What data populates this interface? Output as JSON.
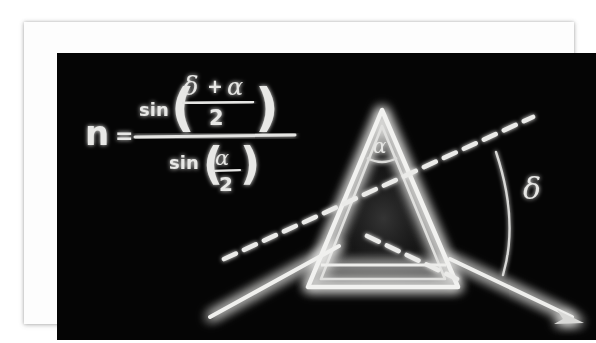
{
  "image": {
    "kind": "photograph-of-physics-diagram",
    "subject": "prism-minimum-deviation",
    "board_color": "#050505",
    "chalk_color": "#e8e8e6",
    "frame_color": "#fdfdfd",
    "page_background": "#ffffff"
  },
  "formula": {
    "variable": "n",
    "equals": "=",
    "numerator": {
      "function": "sin",
      "open_paren": "(",
      "close_paren": ")",
      "arg_numerator_left": "δ",
      "arg_numerator_plus": "+",
      "arg_numerator_right": "α",
      "arg_denominator": "2"
    },
    "denominator": {
      "function": "sin",
      "open_paren": "(",
      "close_paren": ")",
      "arg_numerator": "α",
      "arg_denominator": "2"
    },
    "plain_text": "n = sin((δ + α)/2) / sin(α/2)"
  },
  "diagram": {
    "apex_angle_label": "α",
    "deviation_angle_label": "δ",
    "prism_name": "triangular-prism",
    "incident_ray_name": "incident-ray",
    "exit_ray_name": "refracted-exit-ray",
    "extension_line_name": "incident-ray-extension-dashed",
    "internal_ray_name": "internal-refracted-ray-dashed"
  }
}
